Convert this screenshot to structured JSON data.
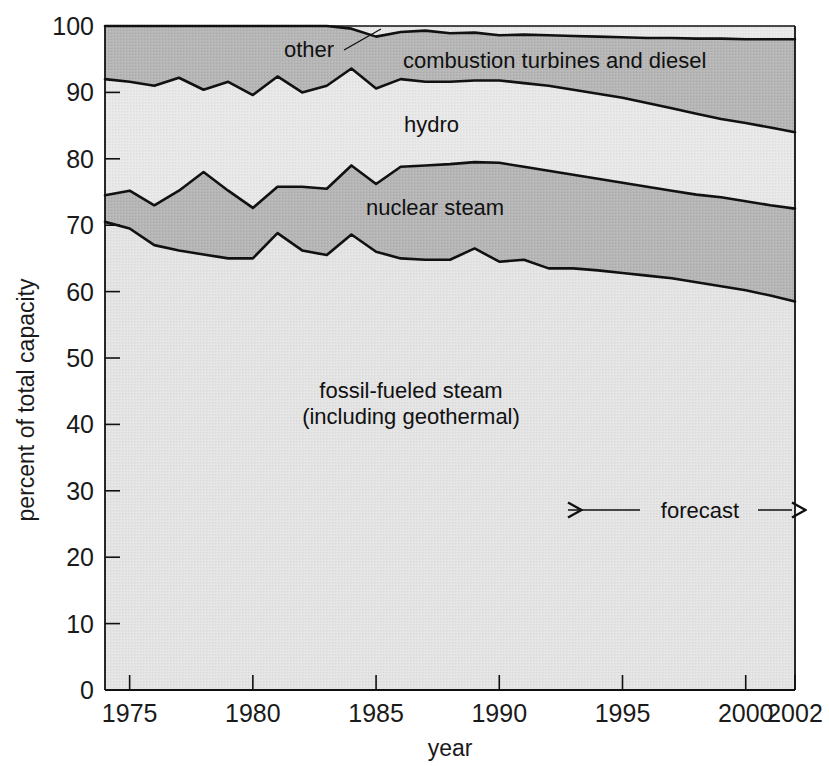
{
  "chart_data": {
    "type": "area",
    "title": "",
    "subtitle": "",
    "xlabel": "year",
    "ylabel": "percent of total capacity",
    "stacked": true,
    "normalized_to_percent": true,
    "grid": false,
    "legend_position": "inline-labels",
    "xlim": [
      1974,
      2002
    ],
    "ylim": [
      0,
      100
    ],
    "y_ticks": [
      0,
      10,
      20,
      30,
      40,
      50,
      60,
      70,
      80,
      90,
      100
    ],
    "x_ticks": [
      1975,
      1980,
      1985,
      1990,
      1995,
      2000,
      2002
    ],
    "x_tick_labels": [
      "1975",
      "1980",
      "1985",
      "1990",
      "1995",
      "2000",
      "2002"
    ],
    "x": [
      1974,
      1975,
      1976,
      1977,
      1978,
      1979,
      1980,
      1981,
      1982,
      1983,
      1984,
      1985,
      1986,
      1987,
      1988,
      1989,
      1990,
      1991,
      1992,
      1993,
      1994,
      1995,
      1996,
      1997,
      1998,
      1999,
      2000,
      2001,
      2002
    ],
    "series": [
      {
        "name": "fossil-fueled steam (including geothermal)",
        "label": "fossil-fueled steam\n(including geothermal)",
        "fill": "#e3e3e3",
        "cumulative_top": [
          70.5,
          69.5,
          67.0,
          66.2,
          65.6,
          65.0,
          65.0,
          68.8,
          66.2,
          65.5,
          68.6,
          66.0,
          65.0,
          64.8,
          64.8,
          66.5,
          64.5,
          64.8,
          63.5,
          63.5,
          63.2,
          62.8,
          62.4,
          62.0,
          61.4,
          60.8,
          60.2,
          59.4,
          58.5
        ]
      },
      {
        "name": "nuclear steam",
        "label": "nuclear steam",
        "fill": "#b4b4b4",
        "cumulative_top": [
          74.5,
          75.2,
          73.0,
          75.2,
          78.0,
          75.2,
          72.6,
          75.8,
          75.8,
          75.5,
          79.0,
          76.2,
          78.8,
          79.0,
          79.2,
          79.5,
          79.4,
          78.8,
          78.2,
          77.6,
          77.0,
          76.4,
          75.8,
          75.2,
          74.6,
          74.2,
          73.6,
          73.0,
          72.5
        ]
      },
      {
        "name": "hydro",
        "label": "hydro",
        "fill": "#e8e8e8",
        "cumulative_top": [
          92.0,
          91.6,
          91.0,
          92.2,
          90.4,
          91.6,
          89.6,
          92.4,
          90.0,
          91.0,
          93.6,
          90.6,
          92.0,
          91.6,
          91.6,
          91.8,
          91.8,
          91.4,
          91.0,
          90.4,
          89.8,
          89.2,
          88.4,
          87.6,
          86.8,
          86.0,
          85.4,
          84.7,
          84.0
        ]
      },
      {
        "name": "combustion turbines and diesel",
        "label": "combustion turbines and diesel",
        "fill": "#b4b4b4",
        "cumulative_top": [
          100.0,
          100.0,
          100.0,
          100.0,
          100.0,
          100.0,
          100.0,
          100.0,
          100.0,
          100.0,
          99.6,
          98.4,
          99.1,
          99.3,
          98.9,
          99.0,
          98.6,
          98.7,
          98.6,
          98.5,
          98.4,
          98.3,
          98.2,
          98.2,
          98.1,
          98.1,
          98.0,
          98.0,
          98.0
        ]
      },
      {
        "name": "other",
        "label": "other",
        "fill": "#e8e8e8",
        "cumulative_top": [
          100.0,
          100.0,
          100.0,
          100.0,
          100.0,
          100.0,
          100.0,
          100.0,
          100.0,
          100.0,
          100.0,
          100.0,
          100.0,
          100.0,
          100.0,
          100.0,
          100.0,
          100.0,
          100.0,
          100.0,
          100.0,
          100.0,
          100.0,
          100.0,
          100.0,
          100.0,
          100.0,
          100.0,
          100.0
        ]
      }
    ],
    "annotations": [
      {
        "name": "forecast",
        "text": "forecast",
        "type": "double-arrow-range",
        "x_start": 1993,
        "x_end": 2002,
        "y": 25
      }
    ]
  },
  "labels": {
    "other": "other",
    "combustion": "combustion turbines and diesel",
    "hydro": "hydro",
    "nuclear": "nuclear steam",
    "fossil_line1": "fossil-fueled steam",
    "fossil_line2": "(including geothermal)",
    "forecast": "forecast"
  },
  "axes": {
    "y_title": "percent of total capacity",
    "x_title": "year",
    "y_ticks": [
      "0",
      "10",
      "20",
      "30",
      "40",
      "50",
      "60",
      "70",
      "80",
      "90",
      "100"
    ],
    "x_ticks": [
      "1975",
      "1980",
      "1985",
      "1990",
      "1995",
      "2000",
      "2002"
    ]
  },
  "colors": {
    "dark_band": "#b4b4b4",
    "light_band": "#e8e8e8",
    "fossil_band": "#e3e3e3",
    "outline": "#111111",
    "text": "#1a1a1a",
    "background": "#ffffff"
  }
}
